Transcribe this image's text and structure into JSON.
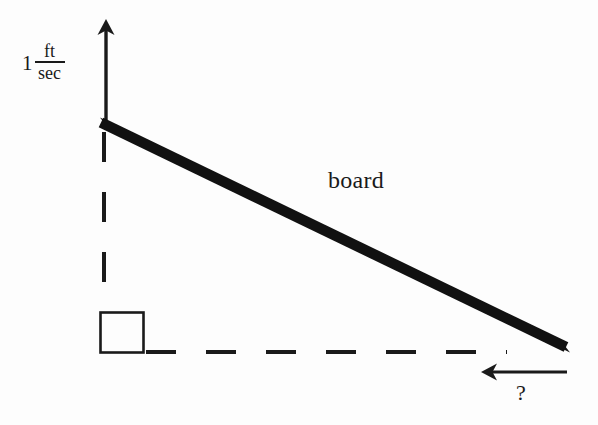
{
  "figure": {
    "background_color": "#fdfdfd",
    "ink_color": "#1a1a1a",
    "width": 598,
    "height": 425
  },
  "labels": {
    "speed_value": "1",
    "speed_numerator": "ft",
    "speed_denominator": "sec",
    "speed_full": "1 ft/sec",
    "board": "board",
    "unknown": "?"
  },
  "icons": {
    "up_arrow": "arrow-up-icon",
    "left_arrow": "arrow-left-icon",
    "right_angle": "right-angle-marker-icon"
  },
  "geometry": {
    "vertical_arrow": {
      "x": 106,
      "y_tail": 128,
      "y_tip": 20,
      "direction": "up"
    },
    "board": {
      "x1": 101,
      "y1": 122,
      "x2": 566,
      "y2": 351,
      "thickness": 11
    },
    "vertical_dashed": {
      "x": 104,
      "y_top": 126,
      "y_bottom": 312
    },
    "horizontal_dashed": {
      "y": 352,
      "x_left": 146,
      "x_right": 506
    },
    "right_angle_square": {
      "x": 100,
      "y": 312,
      "size": 42
    },
    "ground_arrow": {
      "y": 372,
      "x_tail": 566,
      "x_tip": 482,
      "direction": "left"
    }
  }
}
